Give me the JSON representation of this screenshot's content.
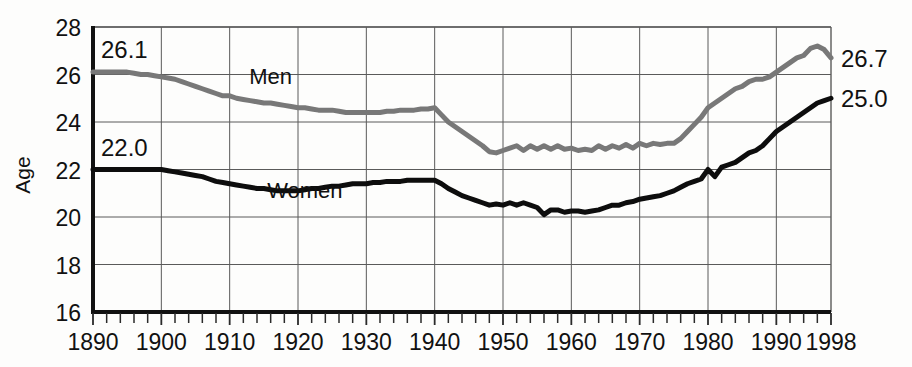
{
  "chart_data": {
    "type": "line",
    "title": "",
    "subtitle": "",
    "xlabel": "",
    "ylabel": "Age",
    "xlim": [
      1890,
      1998
    ],
    "ylim": [
      16,
      28
    ],
    "grid": true,
    "legend_position": "inline-annotation",
    "y_ticks": [
      16,
      18,
      20,
      22,
      24,
      26,
      28
    ],
    "y_tick_labels": [
      "16",
      "18",
      "20",
      "22",
      "24",
      "26",
      "28"
    ],
    "x_ticks": [
      1890,
      1900,
      1910,
      1920,
      1930,
      1940,
      1950,
      1960,
      1970,
      1980,
      1990,
      1998
    ],
    "x_tick_labels": [
      "1890",
      "1900",
      "1910",
      "1920",
      "1930",
      "1940",
      "1950",
      "1960",
      "1970",
      "1980",
      "1990",
      "1998"
    ],
    "x_minor_tick_step": 2,
    "annotations": [
      {
        "name": "men-start-value",
        "text": "26.1",
        "x": 1891,
        "y": 26.1,
        "anchor": "start-above"
      },
      {
        "name": "women-start-value",
        "text": "22.0",
        "x": 1891,
        "y": 22.0,
        "anchor": "start-above"
      },
      {
        "name": "men-end-value",
        "text": "26.7",
        "x": 1998,
        "y": 26.7,
        "anchor": "end-right"
      },
      {
        "name": "women-end-value",
        "text": "25.0",
        "x": 1998,
        "y": 25.0,
        "anchor": "end-right"
      },
      {
        "name": "men-series-label",
        "text": "Men",
        "x": 1916,
        "y": 25.6,
        "anchor": "inline"
      },
      {
        "name": "women-series-label",
        "text": "Women",
        "x": 1921,
        "y": 20.8,
        "anchor": "inline"
      }
    ],
    "series": [
      {
        "name": "Men",
        "color": "#787878",
        "line_width": 5,
        "x": [
          1890,
          1891,
          1892,
          1893,
          1894,
          1895,
          1896,
          1897,
          1898,
          1899,
          1900,
          1901,
          1902,
          1903,
          1904,
          1905,
          1906,
          1907,
          1908,
          1909,
          1910,
          1911,
          1912,
          1913,
          1914,
          1915,
          1916,
          1917,
          1918,
          1919,
          1920,
          1921,
          1922,
          1923,
          1924,
          1925,
          1926,
          1927,
          1928,
          1929,
          1930,
          1931,
          1932,
          1933,
          1934,
          1935,
          1936,
          1937,
          1938,
          1939,
          1940,
          1941,
          1942,
          1943,
          1944,
          1945,
          1946,
          1947,
          1948,
          1949,
          1950,
          1951,
          1952,
          1953,
          1954,
          1955,
          1956,
          1957,
          1958,
          1959,
          1960,
          1961,
          1962,
          1963,
          1964,
          1965,
          1966,
          1967,
          1968,
          1969,
          1970,
          1971,
          1972,
          1973,
          1974,
          1975,
          1976,
          1977,
          1978,
          1979,
          1980,
          1981,
          1982,
          1983,
          1984,
          1985,
          1986,
          1987,
          1988,
          1989,
          1990,
          1991,
          1992,
          1993,
          1994,
          1995,
          1996,
          1997,
          1998
        ],
        "values": [
          26.1,
          26.1,
          26.1,
          26.1,
          26.1,
          26.1,
          26.05,
          26.0,
          26.0,
          25.95,
          25.9,
          25.85,
          25.8,
          25.7,
          25.6,
          25.5,
          25.4,
          25.3,
          25.2,
          25.1,
          25.1,
          25.0,
          24.95,
          24.9,
          24.85,
          24.8,
          24.8,
          24.75,
          24.7,
          24.65,
          24.6,
          24.6,
          24.55,
          24.5,
          24.5,
          24.5,
          24.45,
          24.4,
          24.4,
          24.4,
          24.4,
          24.4,
          24.4,
          24.45,
          24.45,
          24.5,
          24.5,
          24.5,
          24.55,
          24.55,
          24.6,
          24.3,
          24.0,
          23.8,
          23.6,
          23.4,
          23.2,
          23.0,
          22.75,
          22.7,
          22.8,
          22.9,
          23.0,
          22.8,
          23.0,
          22.85,
          23.0,
          22.85,
          23.0,
          22.85,
          22.9,
          22.8,
          22.85,
          22.8,
          23.0,
          22.85,
          23.0,
          22.9,
          23.05,
          22.9,
          23.1,
          23.0,
          23.1,
          23.05,
          23.1,
          23.1,
          23.3,
          23.6,
          23.9,
          24.2,
          24.6,
          24.8,
          25.0,
          25.2,
          25.4,
          25.5,
          25.7,
          25.8,
          25.8,
          25.9,
          26.1,
          26.3,
          26.5,
          26.7,
          26.8,
          27.1,
          27.2,
          27.05,
          26.7
        ]
      },
      {
        "name": "Women",
        "color": "#0d0d0d",
        "line_width": 5,
        "x": [
          1890,
          1891,
          1892,
          1893,
          1894,
          1895,
          1896,
          1897,
          1898,
          1899,
          1900,
          1901,
          1902,
          1903,
          1904,
          1905,
          1906,
          1907,
          1908,
          1909,
          1910,
          1911,
          1912,
          1913,
          1914,
          1915,
          1916,
          1917,
          1918,
          1919,
          1920,
          1921,
          1922,
          1923,
          1924,
          1925,
          1926,
          1927,
          1928,
          1929,
          1930,
          1931,
          1932,
          1933,
          1934,
          1935,
          1936,
          1937,
          1938,
          1939,
          1940,
          1941,
          1942,
          1943,
          1944,
          1945,
          1946,
          1947,
          1948,
          1949,
          1950,
          1951,
          1952,
          1953,
          1954,
          1955,
          1956,
          1957,
          1958,
          1959,
          1960,
          1961,
          1962,
          1963,
          1964,
          1965,
          1966,
          1967,
          1968,
          1969,
          1970,
          1971,
          1972,
          1973,
          1974,
          1975,
          1976,
          1977,
          1978,
          1979,
          1980,
          1981,
          1982,
          1983,
          1984,
          1985,
          1986,
          1987,
          1988,
          1989,
          1990,
          1991,
          1992,
          1993,
          1994,
          1995,
          1996,
          1997,
          1998
        ],
        "values": [
          22.0,
          22.0,
          22.0,
          22.0,
          22.0,
          22.0,
          22.0,
          22.0,
          22.0,
          22.0,
          22.0,
          21.95,
          21.9,
          21.85,
          21.8,
          21.75,
          21.7,
          21.6,
          21.5,
          21.45,
          21.4,
          21.35,
          21.3,
          21.25,
          21.2,
          21.2,
          21.15,
          21.1,
          21.1,
          21.1,
          21.1,
          21.15,
          21.2,
          21.2,
          21.25,
          21.3,
          21.3,
          21.35,
          21.4,
          21.4,
          21.4,
          21.45,
          21.45,
          21.5,
          21.5,
          21.5,
          21.55,
          21.55,
          21.55,
          21.55,
          21.55,
          21.4,
          21.2,
          21.05,
          20.9,
          20.8,
          20.7,
          20.6,
          20.5,
          20.55,
          20.5,
          20.6,
          20.5,
          20.6,
          20.5,
          20.4,
          20.1,
          20.3,
          20.3,
          20.2,
          20.25,
          20.25,
          20.2,
          20.25,
          20.3,
          20.4,
          20.5,
          20.5,
          20.6,
          20.65,
          20.75,
          20.8,
          20.85,
          20.9,
          21.0,
          21.1,
          21.25,
          21.4,
          21.5,
          21.6,
          22.0,
          21.7,
          22.1,
          22.2,
          22.3,
          22.5,
          22.7,
          22.8,
          23.0,
          23.3,
          23.6,
          23.8,
          24.0,
          24.2,
          24.4,
          24.6,
          24.8,
          24.9,
          25.0
        ]
      }
    ]
  },
  "axis": {
    "y_title": "Age"
  }
}
